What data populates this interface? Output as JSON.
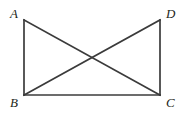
{
  "figure": {
    "name": "two-triangles-on-common-base",
    "canvas": {
      "width": 190,
      "height": 114
    },
    "colors": {
      "background": "#ffffff",
      "stroke": "#3b3b3b",
      "label": "#231f20"
    },
    "stroke_width": 1.7,
    "vertices": [
      {
        "id": "A",
        "label": "A",
        "x": 24,
        "y": 20
      },
      {
        "id": "D",
        "label": "D",
        "x": 160,
        "y": 20
      },
      {
        "id": "B",
        "label": "B",
        "x": 24,
        "y": 95
      },
      {
        "id": "C",
        "label": "C",
        "x": 160,
        "y": 95
      }
    ],
    "segments": [
      {
        "id": "AB",
        "name": "left-side",
        "from": "A",
        "to": "B"
      },
      {
        "id": "DC",
        "name": "right-side",
        "from": "D",
        "to": "C"
      },
      {
        "id": "BC",
        "name": "bottom-base",
        "from": "B",
        "to": "C"
      },
      {
        "id": "AC",
        "name": "diagonal-a-c",
        "from": "A",
        "to": "C"
      },
      {
        "id": "DB",
        "name": "diagonal-d-b",
        "from": "D",
        "to": "B"
      }
    ],
    "intersection": {
      "name": "diagonal-crossing-point",
      "x": 92,
      "y": 57.5
    }
  }
}
